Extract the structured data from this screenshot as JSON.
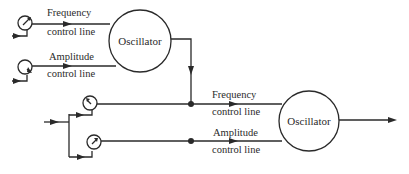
{
  "diagram": {
    "top_oscillator": {
      "label": "Oscillator",
      "frequency_label_1": "Frequency",
      "frequency_label_2": "control line",
      "amplitude_label_1": "Amplitude",
      "amplitude_label_2": "control line"
    },
    "bottom_oscillator": {
      "label": "Oscillator",
      "frequency_label_1": "Frequency",
      "frequency_label_2": "control line",
      "amplitude_label_1": "Amplitude",
      "amplitude_label_2": "control line"
    },
    "icons": [
      "knob-icon",
      "arrow-icon",
      "junction-dot-icon"
    ],
    "colors": {
      "line": "#2a2a2a",
      "background": "#ffffff"
    }
  }
}
